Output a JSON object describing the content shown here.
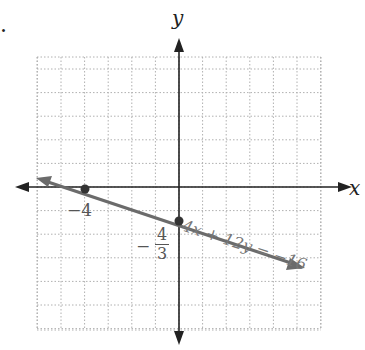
{
  "problem_marker": ".",
  "chart_data": {
    "type": "line",
    "title": "",
    "xlabel": "x",
    "ylabel": "y",
    "equation": "4x + 12y = −16",
    "points": [
      {
        "x": -4,
        "y": 0,
        "label": "−4"
      },
      {
        "x": 0,
        "y": -1.3333,
        "label": "−4/3"
      }
    ],
    "slope": -0.3333,
    "xlim": [
      -6,
      6
    ],
    "ylim": [
      -6,
      5.5
    ],
    "grid": true
  },
  "labels": {
    "x_axis": "x",
    "y_axis": "y",
    "x_intercept": "−4",
    "y_intercept_minus": "−",
    "y_intercept_num": "4",
    "y_intercept_den": "3",
    "equation": "4x + 12y = −16"
  },
  "colors": {
    "line": "#6b6b6b",
    "axis": "#222222",
    "grid": "#b0b0b0"
  }
}
